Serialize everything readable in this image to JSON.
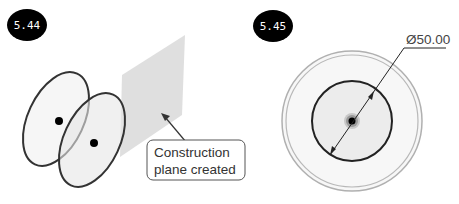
{
  "figures": [
    {
      "badge": "5.44",
      "callout": {
        "line1": "Construction",
        "line2": "plane created"
      }
    },
    {
      "badge": "5.45",
      "dimension": "Ø50.00"
    }
  ],
  "colors": {
    "badge_bg": "#000000",
    "plane_fill": "#d9d9d9",
    "sketch_stroke": "#333333",
    "circle_fill": "#ececec",
    "outer_ring": "#b0b0b0"
  }
}
